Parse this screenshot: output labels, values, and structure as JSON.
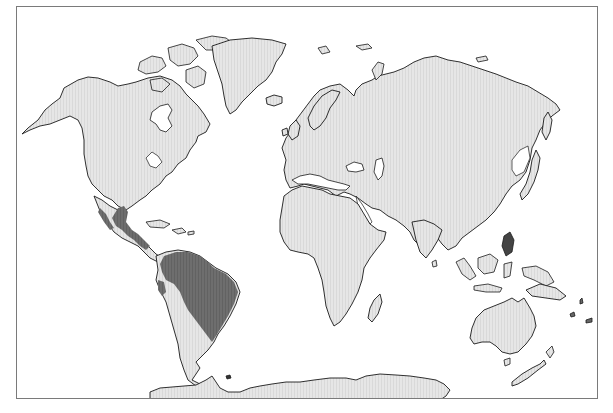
{
  "map": {
    "type": "world-distribution-map",
    "projection_style": "cylindrical world map",
    "colors": {
      "background": "#ffffff",
      "frame": "#7a7a7a",
      "land": "#e6e6e6",
      "land_stripe": "#d6d6d6",
      "coastline": "#1a1a1a",
      "range": "#6e6e6e"
    },
    "regions": [
      {
        "name": "North America",
        "shaded": false
      },
      {
        "name": "Greenland",
        "shaded": false
      },
      {
        "name": "South America",
        "shaded": "partial"
      },
      {
        "name": "Europe",
        "shaded": false
      },
      {
        "name": "Africa",
        "shaded": false
      },
      {
        "name": "Asia",
        "shaded": false
      },
      {
        "name": "Australia",
        "shaded": false
      },
      {
        "name": "Antarctica",
        "shaded": false
      }
    ],
    "highlighted_range": {
      "description": "Dark shaded distribution covering coastal Mexico, Central America, and northern/eastern South America (Amazon basin and Brazil)",
      "areas": [
        "Mexico (Gulf and Pacific coasts)",
        "Central America",
        "Northern South America",
        "Amazon Basin",
        "Eastern Brazil"
      ]
    }
  }
}
